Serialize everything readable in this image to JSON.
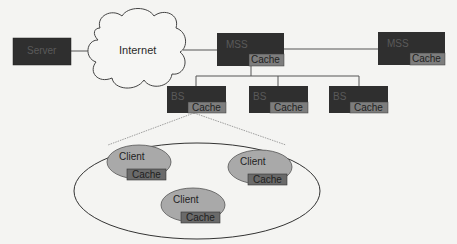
{
  "colors": {
    "background": "#f4f4f2",
    "node_fill": "#2f2f2f",
    "cache_fill": "#7d7d7d",
    "client_fill": "#a9a9a9",
    "client_cache_fill": "#6a6a6a",
    "line": "#555555"
  },
  "diagram": {
    "server": {
      "label": "Server"
    },
    "internet": {
      "label": "Internet",
      "shape": "cloud"
    },
    "mss": [
      {
        "label": "MSS",
        "cache": "Cache"
      },
      {
        "label": "MSS",
        "cache": "Cache"
      }
    ],
    "bs": [
      {
        "label": "BS",
        "cache": "Cache"
      },
      {
        "label": "BS",
        "cache": "Cache"
      },
      {
        "label": "BS",
        "cache": "Cache"
      }
    ],
    "cell": {
      "shape": "ellipse",
      "clients": [
        {
          "label": "Client",
          "cache": "Cache"
        },
        {
          "label": "Client",
          "cache": "Cache"
        },
        {
          "label": "Client",
          "cache": "Cache"
        }
      ]
    },
    "edges": [
      [
        "Server",
        "Internet"
      ],
      [
        "Internet",
        "MSS 1"
      ],
      [
        "MSS 1",
        "MSS 2"
      ],
      [
        "MSS 1",
        "BS 1"
      ],
      [
        "MSS 1",
        "BS 2"
      ],
      [
        "MSS 1",
        "BS 3"
      ],
      [
        "BS 1",
        "Cell (zoom, dashed)"
      ]
    ]
  }
}
